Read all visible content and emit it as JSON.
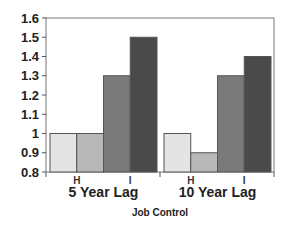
{
  "chart_data": {
    "type": "bar",
    "title": "",
    "xlabel": "Job Control",
    "ylabel": "",
    "categories": [
      "5 Year Lag",
      "10 Year Lag"
    ],
    "series": [
      {
        "name": "Series 1",
        "values": [
          1.0,
          1.0
        ],
        "color": "#e4e4e4"
      },
      {
        "name": "Series 2",
        "values": [
          1.0,
          0.9
        ],
        "color": "#b8b8b8"
      },
      {
        "name": "Series 3",
        "values": [
          1.3,
          1.3
        ],
        "color": "#7a7a7a"
      },
      {
        "name": "Series 4",
        "values": [
          1.5,
          1.4
        ],
        "color": "#4a4a4a"
      }
    ],
    "ylim": [
      0.8,
      1.6
    ],
    "yticks": [
      "0.8",
      "0.9",
      "1",
      "1.1",
      "1.2",
      "1.3",
      "1.4",
      "1.5",
      "1.6"
    ],
    "grid": false,
    "legend": "none",
    "annotations": [
      "H",
      "I",
      "H",
      "I"
    ]
  }
}
